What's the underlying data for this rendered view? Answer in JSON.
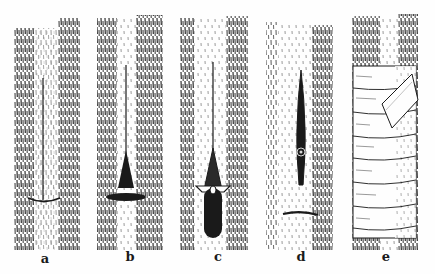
{
  "figure": {
    "panels": [
      {
        "label": "a",
        "description": "T-shaped cut in bark"
      },
      {
        "label": "b",
        "description": "Bark flaps opened at T-cut"
      },
      {
        "label": "c",
        "description": "Bud shield inserted into cut"
      },
      {
        "label": "d",
        "description": "Bud seated under bark"
      },
      {
        "label": "e",
        "description": "Bud wrapped with binding"
      }
    ],
    "colors": {
      "ink": "#1a1a1a",
      "paper": "#fefefe"
    }
  }
}
